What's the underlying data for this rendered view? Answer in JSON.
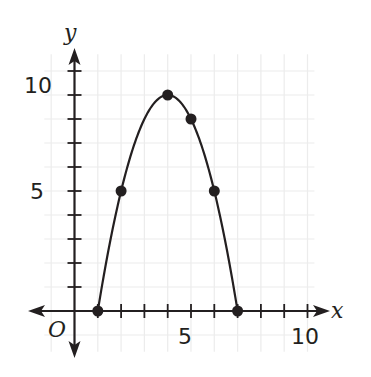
{
  "chart_data": {
    "type": "line",
    "title": "",
    "xlabel": "x",
    "ylabel": "y",
    "origin_label": "O",
    "xlim": [
      -1.5,
      11
    ],
    "ylim": [
      -2,
      11
    ],
    "x_ticks": [
      1,
      2,
      3,
      4,
      5,
      6,
      7,
      8,
      9,
      10
    ],
    "y_ticks": [
      1,
      2,
      3,
      4,
      5,
      6,
      7,
      8,
      9,
      10
    ],
    "x_tick_labels": [
      "5",
      "10"
    ],
    "y_tick_labels": [
      "5",
      "10"
    ],
    "grid": true,
    "curve": {
      "equation": "y = -x^2 + 8x - 7",
      "x_range": [
        1,
        7
      ]
    },
    "points": [
      {
        "x": 1,
        "y": 0
      },
      {
        "x": 2,
        "y": 5
      },
      {
        "x": 4,
        "y": 9
      },
      {
        "x": 5,
        "y": 8
      },
      {
        "x": 6,
        "y": 5
      },
      {
        "x": 7,
        "y": 0
      }
    ],
    "colors": {
      "axis": "#231f20",
      "curve": "#231f20",
      "grid": "#ececec"
    }
  }
}
